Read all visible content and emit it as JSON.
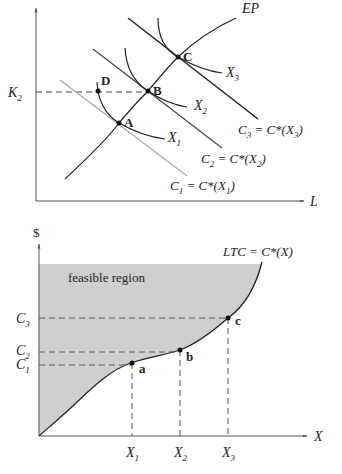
{
  "top_panel": {
    "y_axis_label": "",
    "x_axis_label": "L",
    "k_level_label": "K",
    "k_level_sub": "2",
    "expansion_path_label": "EP",
    "points": {
      "A": "A",
      "B": "B",
      "C": "C",
      "D": "D"
    },
    "isoquants": [
      {
        "label": "X",
        "sub": "1"
      },
      {
        "label": "X",
        "sub": "2"
      },
      {
        "label": "X",
        "sub": "3"
      }
    ],
    "isocosts": [
      {
        "c": "C",
        "c_sub": "1",
        "eq": " = C*(X",
        "x_sub": "1",
        "close": ")"
      },
      {
        "c": "C",
        "c_sub": "2",
        "eq": " = C*(X",
        "x_sub": "2",
        "close": ")"
      },
      {
        "c": "C",
        "c_sub": "3",
        "eq": " = C*(X",
        "x_sub": "3",
        "close": ")"
      }
    ]
  },
  "bottom_panel": {
    "y_axis_label": "$",
    "x_axis_label": "X",
    "curve_label": "LTC = C*(X)",
    "region_label": "feasible region",
    "points": {
      "a": "a",
      "b": "b",
      "c": "c"
    },
    "y_ticks": [
      {
        "label": "C",
        "sub": "3"
      },
      {
        "label": "C",
        "sub": "2"
      },
      {
        "label": "C",
        "sub": "1"
      }
    ],
    "x_ticks": [
      {
        "label": "X",
        "sub": "1"
      },
      {
        "label": "X",
        "sub": "2"
      },
      {
        "label": "X",
        "sub": "3"
      }
    ],
    "colors": {
      "region_fill": "#cfcfcf",
      "curve": "#222222"
    }
  }
}
